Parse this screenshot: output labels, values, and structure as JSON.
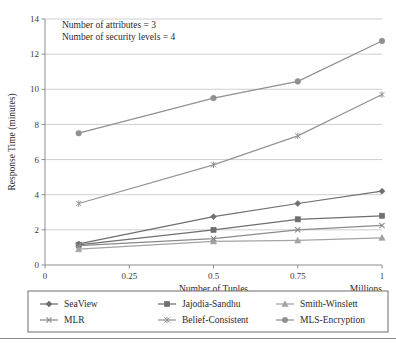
{
  "figure": {
    "annotation_lines": [
      "Number of attributes = 3",
      "Number of security levels = 4"
    ],
    "accent_colors": {
      "seaview": "#6f6f6f",
      "jajodia_sandhu": "#6f6f6f",
      "smith_winslett": "#a3a3a3",
      "mlr": "#8a8a8a",
      "belief_consistent": "#949494",
      "mls_encryption": "#909090",
      "grid": "#c9c9c9",
      "axis": "#8d8d8d",
      "text": "#2b2b2b"
    }
  },
  "chart_data": {
    "type": "line",
    "title": "",
    "xlabel": "Number of Tuples",
    "xlabel_unit": "Millions",
    "ylabel": "Response Time  (minutes)",
    "x": [
      0.1,
      0.5,
      0.75,
      1
    ],
    "xticks": [
      "0",
      "0.25",
      "0.5",
      "0.75",
      "1"
    ],
    "xtick_values": [
      0,
      0.25,
      0.5,
      0.75,
      1
    ],
    "yticks": [
      "0",
      "2",
      "4",
      "6",
      "8",
      "10",
      "12",
      "14"
    ],
    "ytick_values": [
      0,
      2,
      4,
      6,
      8,
      10,
      12,
      14
    ],
    "xlim": [
      0,
      1
    ],
    "ylim": [
      0,
      14
    ],
    "grid": true,
    "legend_position": "bottom",
    "series": [
      {
        "name": "SeaView",
        "marker": "diamond",
        "color": "#6f6f6f",
        "values": [
          1.2,
          2.75,
          3.5,
          4.2
        ]
      },
      {
        "name": "Jajodia-Sandhu",
        "marker": "square",
        "color": "#6f6f6f",
        "values": [
          1.15,
          2.0,
          2.6,
          2.8
        ]
      },
      {
        "name": "Smith-Winslett",
        "marker": "triangle",
        "color": "#a3a3a3",
        "values": [
          0.9,
          1.35,
          1.4,
          1.55
        ]
      },
      {
        "name": "MLR",
        "marker": "cross",
        "color": "#8a8a8a",
        "values": [
          1.1,
          1.5,
          2.0,
          2.25
        ]
      },
      {
        "name": "Belief-Consistent",
        "marker": "asterisk",
        "color": "#949494",
        "values": [
          3.5,
          5.7,
          7.35,
          9.7
        ]
      },
      {
        "name": "MLS-Encryption",
        "marker": "circle",
        "color": "#909090",
        "values": [
          7.5,
          9.5,
          10.45,
          12.75
        ]
      }
    ]
  }
}
